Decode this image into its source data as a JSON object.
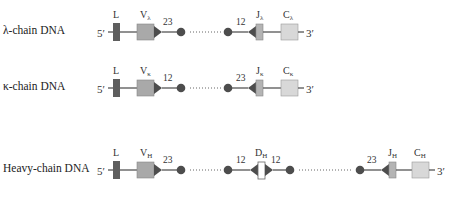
{
  "rows": [
    {
      "label": "λ-chain DNA",
      "five_prime": "5′",
      "three_prime": "3′",
      "L": "L",
      "V": "V",
      "V_sub": "λ",
      "rss_v_spacer": "23",
      "rss_j_spacer": "12",
      "J": "J",
      "J_sub": "λ",
      "C": "C",
      "C_sub": "λ"
    },
    {
      "label": "κ-chain DNA",
      "five_prime": "5′",
      "three_prime": "3′",
      "L": "L",
      "V": "V",
      "V_sub": "κ",
      "rss_v_spacer": "12",
      "rss_j_spacer": "23",
      "J": "J",
      "J_sub": "κ",
      "C": "C",
      "C_sub": "κ"
    },
    {
      "label": "Heavy-chain DNA",
      "five_prime": "5′",
      "three_prime": "3′",
      "L": "L",
      "V": "V",
      "V_sub": "H",
      "rss_v_spacer": "23",
      "rss_d_left_spacer": "12",
      "D": "D",
      "D_sub": "H",
      "rss_d_right_spacer": "12",
      "rss_j_spacer": "23",
      "J": "J",
      "J_sub": "H",
      "C": "C",
      "C_sub": "H"
    }
  ],
  "colors": {
    "L_segment": "#5e5e5e",
    "V_segment": "#a9a9a9",
    "J_segment": "#b4b4b4",
    "C_segment": "#d8d8d8",
    "D_segment": "#ffffff",
    "rss_marker": "#4d4d4d",
    "line": "#555555"
  }
}
